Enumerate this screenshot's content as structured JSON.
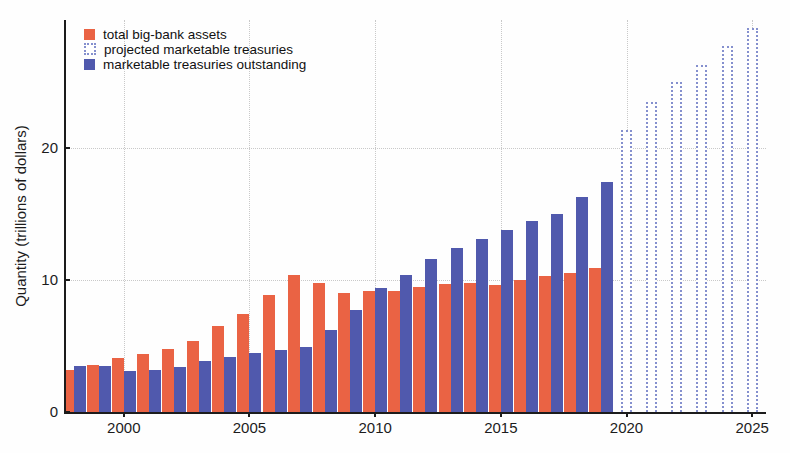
{
  "colors": {
    "bank_assets": "#ea6344",
    "treasuries": "#5059ad",
    "projected_outline": "#8590ce",
    "grid": "#c9c9c9",
    "axis": "#1c1c1c"
  },
  "legend": [
    {
      "label": "total big-bank assets",
      "swatch": "solid-orange"
    },
    {
      "label": "projected marketable treasuries",
      "swatch": "dotted-outline"
    },
    {
      "label": "marketable treasuries outstanding",
      "swatch": "solid-blue"
    }
  ],
  "chart_data": {
    "type": "bar",
    "title": "",
    "xlabel": "",
    "ylabel": "Quantity (trillions of dollars)",
    "ylim": [
      0,
      29.7
    ],
    "xlim": [
      1997.7,
      2025.55
    ],
    "y_ticks": [
      0,
      10,
      20
    ],
    "x_ticks": [
      2000,
      2005,
      2010,
      2015,
      2020,
      2025
    ],
    "grid": "dotted",
    "legend_position": "top-left",
    "years": [
      1998,
      1999,
      2000,
      2001,
      2002,
      2003,
      2004,
      2005,
      2006,
      2007,
      2008,
      2009,
      2010,
      2011,
      2012,
      2013,
      2014,
      2015,
      2016,
      2017,
      2018,
      2019
    ],
    "series": [
      {
        "name": "total big-bank assets",
        "color_key": "bank_assets",
        "values": [
          3.2,
          3.6,
          4.1,
          4.4,
          4.8,
          5.4,
          6.5,
          7.4,
          8.9,
          10.4,
          9.8,
          9.0,
          9.2,
          9.2,
          9.5,
          9.7,
          9.8,
          9.6,
          10.0,
          10.3,
          10.5,
          10.9
        ]
      },
      {
        "name": "marketable treasuries outstanding",
        "color_key": "treasuries",
        "values": [
          3.5,
          3.5,
          3.1,
          3.2,
          3.4,
          3.9,
          4.2,
          4.5,
          4.7,
          4.9,
          6.2,
          7.7,
          9.4,
          10.4,
          11.6,
          12.4,
          13.1,
          13.8,
          14.5,
          15.0,
          16.3,
          17.4
        ]
      }
    ],
    "projected_series": {
      "name": "projected marketable treasuries",
      "years": [
        2020,
        2021,
        2022,
        2023,
        2024,
        2025
      ],
      "values": [
        21.4,
        23.5,
        25.0,
        26.3,
        27.7,
        29.1
      ]
    }
  }
}
